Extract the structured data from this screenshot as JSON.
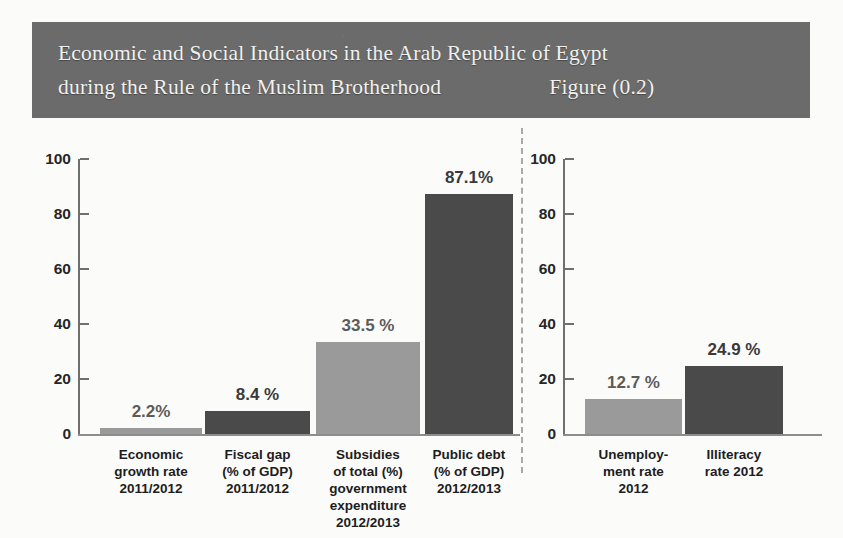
{
  "title": {
    "line1": "Economic and Social Indicators in the Arab Republic of Egypt",
    "line2": "during the Rule of the Muslim Brotherhood",
    "figure_label": "Figure (0.2)"
  },
  "colors": {
    "banner_background": "#6b6b6b",
    "banner_text": "#f2f1ee",
    "bar_light": "#9a9a9a",
    "bar_dark": "#4a4a4a",
    "axis": "#6f6f6f",
    "value_label": "#5b5b5b",
    "divider": "#a9a9a9"
  },
  "chart_data": [
    {
      "type": "bar",
      "title": "Economic and Social Indicators in the Arab Republic of Egypt during the Rule of the Muslim Brotherhood",
      "panel": "left",
      "xlabel": "",
      "ylabel": "",
      "ylim": [
        0,
        100
      ],
      "yticks": [
        0,
        20,
        40,
        60,
        80,
        100
      ],
      "ytick_labels": [
        "0",
        "20",
        "40",
        "60",
        "80",
        "100"
      ],
      "grid": false,
      "legend": "none",
      "categories": [
        "Economic\ngrowth rate\n2011/2012",
        "Fiscal gap\n(% of GDP)\n2011/2012",
        "Subsidies\nof total (%)\ngovernment\nexpenditure\n2012/2013",
        "Public debt\n(% of GDP)\n2012/2013"
      ],
      "values": [
        2.2,
        8.4,
        33.5,
        87.1
      ],
      "data_labels": [
        "2.2%",
        "8.4 %",
        "33.5 %",
        "87.1%"
      ],
      "bar_colors": [
        "#9a9a9a",
        "#4a4a4a",
        "#9a9a9a",
        "#4a4a4a"
      ]
    },
    {
      "type": "bar",
      "panel": "right",
      "xlabel": "",
      "ylabel": "",
      "ylim": [
        0,
        100
      ],
      "yticks": [
        0,
        20,
        40,
        60,
        80,
        100
      ],
      "ytick_labels": [
        "0",
        "20",
        "40",
        "60",
        "80",
        "100"
      ],
      "grid": false,
      "legend": "none",
      "categories": [
        "Unemploy-\nment rate\n2012",
        "Illiteracy\nrate 2012"
      ],
      "values": [
        12.7,
        24.9
      ],
      "data_labels": [
        "12.7 %",
        "24.9 %"
      ],
      "bar_colors": [
        "#9a9a9a",
        "#4a4a4a"
      ]
    }
  ]
}
